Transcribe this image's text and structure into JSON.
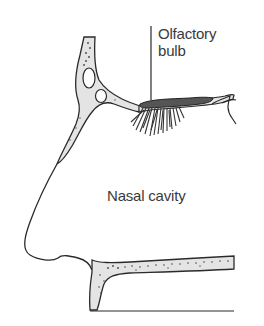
{
  "diagram": {
    "type": "anatomical-cross-section",
    "labels": {
      "olfactory_bulb_line1": "Olfactory",
      "olfactory_bulb_line2": "bulb",
      "nasal_cavity": "Nasal cavity"
    },
    "colors": {
      "outline": "#2a2a2a",
      "bone_fill": "#e4e4e4",
      "text": "#3a3a3a",
      "background": "#ffffff"
    }
  }
}
